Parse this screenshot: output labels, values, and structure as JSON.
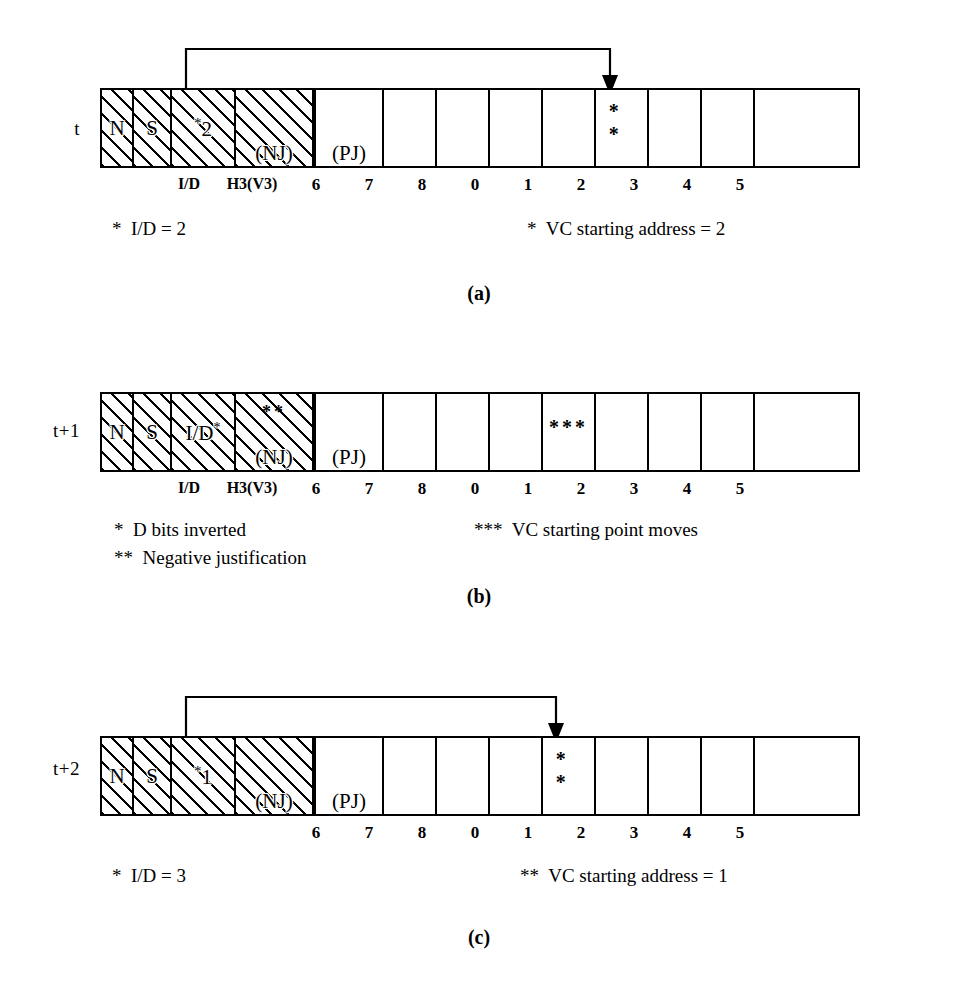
{
  "figure": {
    "panels": [
      {
        "tag": "(a)",
        "time_label": "t",
        "overhead_cells": [
          {
            "name": "N",
            "text": "N",
            "sub": ""
          },
          {
            "name": "S",
            "text": "S",
            "sub": ""
          },
          {
            "name": "ID",
            "text": "2",
            "star": "*",
            "sub": ""
          },
          {
            "name": "H3V3",
            "text": "",
            "paren": "(NJ)"
          },
          {
            "name": "PJ",
            "text": "",
            "paren": "(PJ)"
          }
        ],
        "axis_names": [
          "I/D",
          "H3(V3)"
        ],
        "payload_labels": [
          "6",
          "7",
          "8",
          "0",
          "1",
          "2",
          "3",
          "4",
          "5"
        ],
        "marker_cell_index": 5,
        "marker_text": "* *",
        "arrow": {
          "from_cell": "ID",
          "to_label": "2",
          "visible": true
        },
        "caption_left": "*  I/D = 2",
        "caption_right": "*  VC starting address = 2"
      },
      {
        "tag": "(b)",
        "time_label": "t+1",
        "overhead_cells": [
          {
            "name": "N",
            "text": "N",
            "sub": ""
          },
          {
            "name": "S",
            "text": "S",
            "sub": ""
          },
          {
            "name": "ID",
            "text": "I/D",
            "sup": "*",
            "sub": ""
          },
          {
            "name": "H3V3",
            "text": "",
            "paren": "(NJ)",
            "top_stars": "**"
          },
          {
            "name": "PJ",
            "text": "",
            "paren": "(PJ)"
          }
        ],
        "axis_names": [
          "I/D",
          "H3(V3)"
        ],
        "payload_labels": [
          "6",
          "7",
          "8",
          "0",
          "1",
          "2",
          "3",
          "4",
          "5"
        ],
        "marker_cell_index": 4,
        "marker_text": "***",
        "arrow": {
          "from_cell": "",
          "to_label": "",
          "visible": false
        },
        "caption_left": "*  D bits inverted\n**  Negative justification",
        "caption_right": "***  VC starting point moves"
      },
      {
        "tag": "(c)",
        "time_label": "t+2",
        "overhead_cells": [
          {
            "name": "N",
            "text": "N",
            "sub": ""
          },
          {
            "name": "S",
            "text": "S",
            "sub": ""
          },
          {
            "name": "ID",
            "text": "1",
            "star": "*",
            "sub": ""
          },
          {
            "name": "H3V3",
            "text": "",
            "paren": "(NJ)"
          },
          {
            "name": "PJ",
            "text": "",
            "paren": "(PJ)"
          }
        ],
        "axis_names": [],
        "payload_labels": [
          "6",
          "7",
          "8",
          "0",
          "1",
          "2",
          "3",
          "4",
          "5"
        ],
        "marker_cell_index": 4,
        "marker_text": "* *",
        "arrow": {
          "from_cell": "ID",
          "to_label": "1",
          "visible": true
        },
        "caption_left": "*  I/D = 3",
        "caption_right": "**  VC starting address = 1"
      }
    ]
  },
  "colors": {
    "ink": "#000000",
    "paper": "#ffffff"
  }
}
